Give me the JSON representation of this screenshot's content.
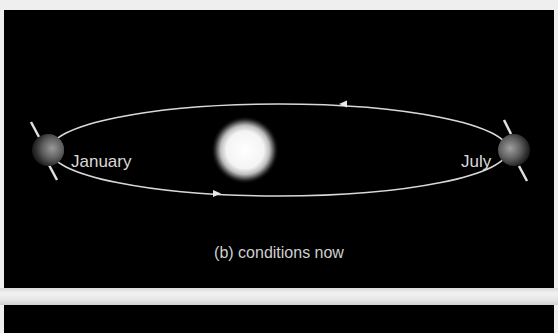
{
  "figure": {
    "panel_caption": "(b) conditions now",
    "labels": {
      "january": "January",
      "july": "July"
    },
    "elements": {
      "sun": "sun-icon",
      "earth_january": "earth-icon",
      "earth_july": "earth-icon",
      "orbit": "elliptical-orbit",
      "orbit_direction": "counterclockwise"
    },
    "colors": {
      "background": "#000000",
      "page": "#efefef",
      "orbit_line": "#d8d8d8",
      "text": "#d9d9d9",
      "sun": "#ffffff"
    }
  }
}
